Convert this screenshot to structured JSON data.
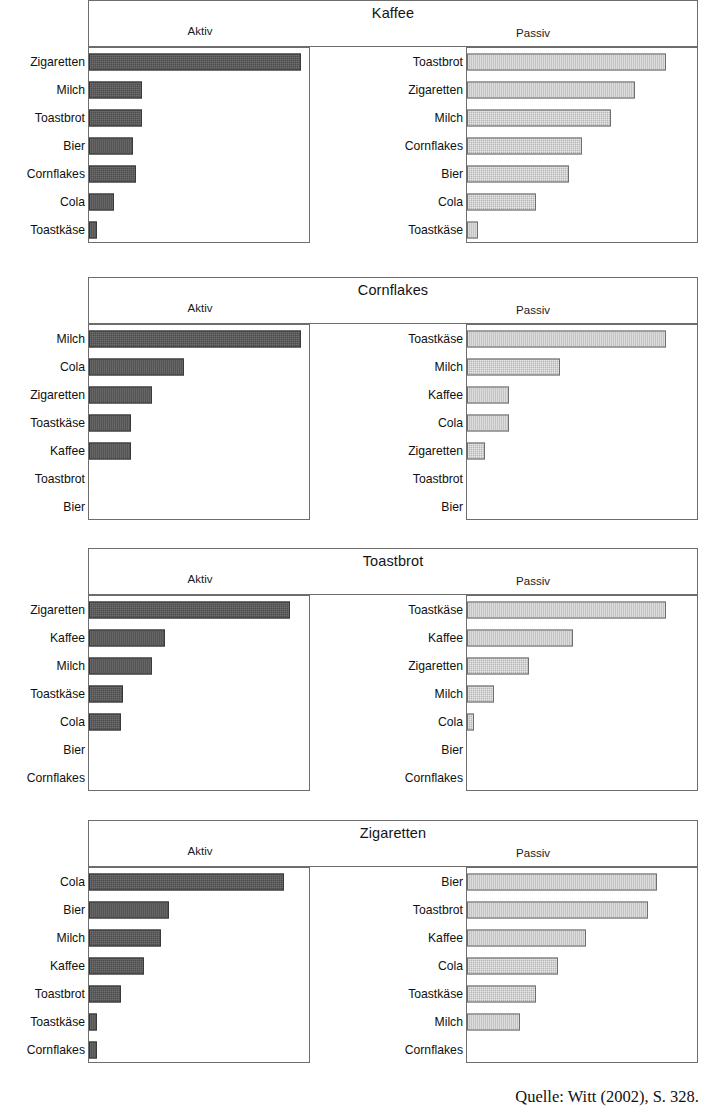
{
  "figure": {
    "source_note": "Quelle: Witt (2002), S. 328.",
    "colors": {
      "aktiv_bar": "#4c4c4c",
      "passiv_bar": "#b4b4b4",
      "frame": "#6d6d6d",
      "background": "#ffffff",
      "text": "#101010"
    },
    "column_labels": {
      "aktiv": "Aktiv",
      "passiv": "Passiv"
    }
  },
  "chart_data": [
    {
      "type": "bar",
      "title": "Kaffee",
      "orientation": "horizontal",
      "xlabel": "",
      "ylabel": "",
      "grid": false,
      "legend": "none",
      "panels": [
        {
          "name": "Aktiv",
          "categories": [
            "Zigaretten",
            "Milch",
            "Toastbrot",
            "Bier",
            "Cornflakes",
            "Cola",
            "Toastkäse"
          ],
          "values": [
            100,
            25,
            25,
            21,
            22,
            12,
            4
          ],
          "xlim": [
            0,
            104
          ]
        },
        {
          "name": "Passiv",
          "categories": [
            "Toastbrot",
            "Zigaretten",
            "Milch",
            "Cornflakes",
            "Bier",
            "Cola",
            "Toastkäse"
          ],
          "values": [
            90,
            76,
            65,
            52,
            46,
            31,
            5
          ],
          "xlim": [
            0,
            104
          ]
        }
      ]
    },
    {
      "type": "bar",
      "title": "Cornflakes",
      "orientation": "horizontal",
      "xlabel": "",
      "ylabel": "",
      "grid": false,
      "legend": "none",
      "panels": [
        {
          "name": "Aktiv",
          "categories": [
            "Milch",
            "Cola",
            "Zigaretten",
            "Toastkäse",
            "Kaffee",
            "Toastbrot",
            "Bier"
          ],
          "values": [
            100,
            45,
            30,
            20,
            20,
            0,
            0
          ],
          "xlim": [
            0,
            104
          ]
        },
        {
          "name": "Passiv",
          "categories": [
            "Toastkäse",
            "Milch",
            "Kaffee",
            "Cola",
            "Zigaretten",
            "Toastbrot",
            "Bier"
          ],
          "values": [
            90,
            42,
            19,
            19,
            8,
            0,
            0
          ],
          "xlim": [
            0,
            104
          ]
        }
      ]
    },
    {
      "type": "bar",
      "title": "Toastbrot",
      "orientation": "horizontal",
      "xlabel": "",
      "ylabel": "",
      "grid": false,
      "legend": "none",
      "panels": [
        {
          "name": "Aktiv",
          "categories": [
            "Zigaretten",
            "Kaffee",
            "Milch",
            "Toastkäse",
            "Cola",
            "Bier",
            "Cornflakes"
          ],
          "values": [
            95,
            36,
            30,
            16,
            15,
            0,
            0
          ],
          "xlim": [
            0,
            104
          ]
        },
        {
          "name": "Passiv",
          "categories": [
            "Toastkäse",
            "Kaffee",
            "Zigaretten",
            "Milch",
            "Cola",
            "Bier",
            "Cornflakes"
          ],
          "values": [
            90,
            48,
            28,
            12,
            3,
            0,
            0
          ],
          "xlim": [
            0,
            104
          ]
        }
      ]
    },
    {
      "type": "bar",
      "title": "Zigaretten",
      "orientation": "horizontal",
      "xlabel": "",
      "ylabel": "",
      "grid": false,
      "legend": "none",
      "panels": [
        {
          "name": "Aktiv",
          "categories": [
            "Cola",
            "Bier",
            "Milch",
            "Kaffee",
            "Toastbrot",
            "Toastkäse",
            "Cornflakes"
          ],
          "values": [
            92,
            38,
            34,
            26,
            15,
            4,
            4
          ],
          "xlim": [
            0,
            104
          ]
        },
        {
          "name": "Passiv",
          "categories": [
            "Bier",
            "Toastbrot",
            "Kaffee",
            "Cola",
            "Toastkäse",
            "Milch",
            "Cornflakes"
          ],
          "values": [
            86,
            82,
            54,
            41,
            31,
            24,
            0
          ],
          "xlim": [
            0,
            104
          ]
        }
      ]
    }
  ],
  "layout": {
    "panel_tops": [
      0,
      277,
      548,
      820
    ],
    "plot_top": 47,
    "plot_height": 196,
    "row_height": 27
  }
}
